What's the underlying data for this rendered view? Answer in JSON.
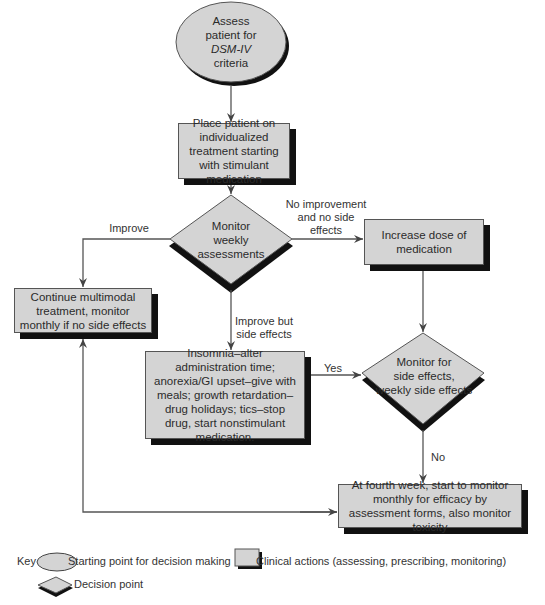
{
  "nodes": {
    "start": {
      "line1": "Assess",
      "line2": "patient for",
      "line3": "DSM-IV",
      "line4": "criteria"
    },
    "place_patient": "Place patient on individualized treatment starting with stimulant medication",
    "monitor_weekly": {
      "line1": "Monitor",
      "line2": "weekly",
      "line3": "assessments"
    },
    "increase_dose": "Increase dose of medication",
    "continue_multimodal": "Continue multimodal treatment, monitor monthly if no side effects",
    "side_effect_actions": "Insomnia–alter administration time; anorexia/GI upset–give with meals; growth retardation–drug holidays; tics–stop drug, start nonstimulant medication.",
    "monitor_side_effects": {
      "line1": "Monitor for",
      "line2": "side effects,",
      "line3": "weekly side effects"
    },
    "fourth_week": "At fourth week, start to monitor monthly for efficacy by assessment forms, also monitor toxicity"
  },
  "edge_labels": {
    "improve": "Improve",
    "no_improvement": "No improvement and no side effects",
    "improve_but_side_effects": "Improve but side effects",
    "yes": "Yes",
    "no": "No"
  },
  "key": {
    "title": "Key",
    "ellipse": "Starting point for decision making",
    "rectangle": "Clinical actions (assessing, prescribing, monitoring)",
    "diamond": "Decision point"
  },
  "colors": {
    "fill": "#d4d4d4",
    "shadow": "#111111",
    "line": "#555555"
  }
}
